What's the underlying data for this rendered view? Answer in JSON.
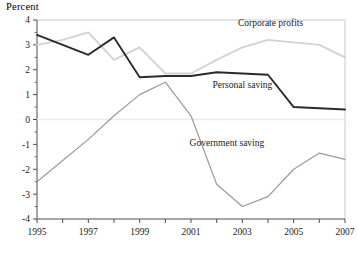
{
  "chart_data": {
    "type": "line",
    "title": "",
    "ylabel": "Percent",
    "xlabel": "",
    "xlim": [
      1995,
      2007
    ],
    "ylim": [
      -4,
      4
    ],
    "yticks": [
      4,
      3,
      2,
      1,
      0,
      -1,
      -2,
      -3,
      -4
    ],
    "ytick_labels": [
      "4",
      "3",
      "2",
      "1",
      "0",
      "-1",
      "-2",
      "-3",
      "-4"
    ],
    "yminor_step": 0.5,
    "xticks": [
      1995,
      1996,
      1997,
      1998,
      1999,
      2000,
      2001,
      2002,
      2003,
      2004,
      2005,
      2006,
      2007
    ],
    "xtick_labels": [
      "1995",
      "",
      "1997",
      "",
      "1999",
      "",
      "2001",
      "",
      "2003",
      "",
      "2005",
      "",
      "2007"
    ],
    "xtick_labels_shown": [
      "1995",
      "1997",
      "1999",
      "2001",
      "2003",
      "2005",
      "2007"
    ],
    "grid": false,
    "zero_line": true,
    "legend": "inline-annotations",
    "x": [
      1995,
      1996,
      1997,
      1998,
      1999,
      2000,
      2001,
      2002,
      2003,
      2004,
      2005,
      2006,
      2007
    ],
    "series": [
      {
        "name": "Personal saving",
        "color": "#2b2b2b",
        "width": 1.9,
        "values": [
          3.4,
          3.0,
          2.6,
          3.3,
          1.7,
          1.75,
          1.75,
          1.9,
          1.85,
          1.8,
          0.5,
          0.45,
          0.4
        ]
      },
      {
        "name": "Corporate profits",
        "color": "#d2d2d2",
        "width": 1.9,
        "values": [
          3.0,
          3.2,
          3.5,
          2.4,
          2.9,
          1.85,
          1.85,
          2.4,
          2.9,
          3.2,
          3.1,
          3.0,
          2.5
        ]
      },
      {
        "name": "Government saving",
        "color": "#9a9a9a",
        "width": 1.2,
        "values": [
          -2.5,
          -1.65,
          -0.8,
          0.15,
          1.0,
          1.5,
          0.15,
          -2.6,
          -3.5,
          -3.1,
          -2.0,
          -1.35,
          -1.6
        ]
      }
    ],
    "annotations": [
      {
        "text": "Corporate profits",
        "x": 2004.1,
        "y": 3.75
      },
      {
        "text": "Personal saving",
        "x": 2003.0,
        "y": 1.25
      },
      {
        "text": "Government saving",
        "x": 2002.4,
        "y": -1.05
      }
    ],
    "colors": {
      "personal_saving": "#2b2b2b",
      "corporate_profits": "#d2d2d2",
      "government_saving": "#9a9a9a",
      "axis": "#4d4d4d",
      "frame": "#c9c9c9",
      "zero_line": "#f0e8ea",
      "background": "#ffffff"
    }
  }
}
